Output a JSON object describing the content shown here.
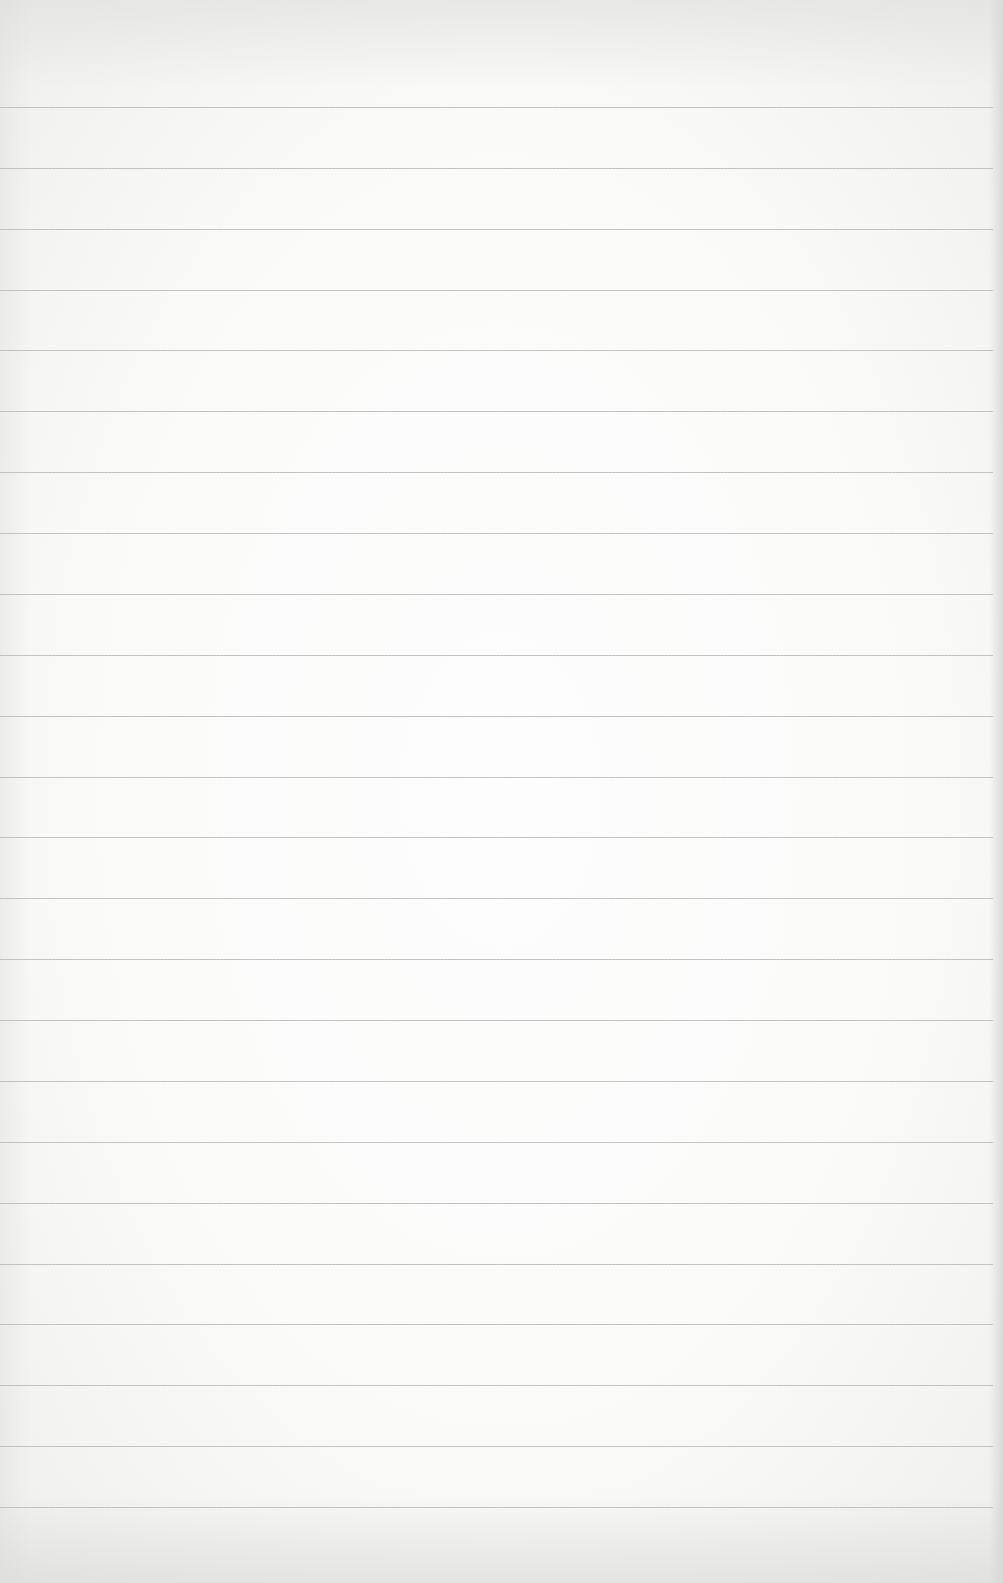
{
  "page": {
    "type": "lined-paper",
    "background_color": "#fbfbfa",
    "line_color": "#c2c2c0",
    "line_count": 24,
    "first_line_y": 107,
    "line_spacing": 60.87
  }
}
